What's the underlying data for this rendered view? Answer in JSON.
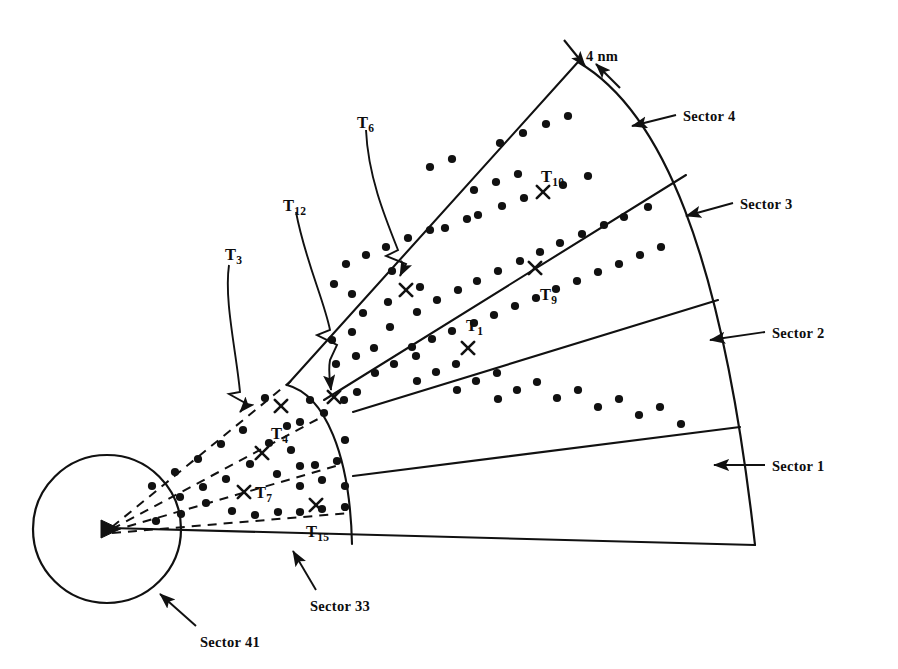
{
  "figure": {
    "type": "sector-coverage-diagram",
    "title": "",
    "scale_annotation": {
      "label": "4 nm",
      "name": "four-nm-scale-marker"
    }
  },
  "origin": {
    "marker": "triangle-marker",
    "x": 110,
    "y": 528
  },
  "inner_circle": {
    "label": "Sector 41",
    "cx": 107,
    "cy": 529,
    "r": 74
  },
  "sector_labels": [
    {
      "id": "sector-1",
      "label": "Sector 1",
      "text_x": 772,
      "text_y": 458,
      "arrow_from_x": 765,
      "arrow_from_y": 465,
      "arrow_to_x": 714,
      "arrow_to_y": 465
    },
    {
      "id": "sector-2",
      "label": "Sector 2",
      "text_x": 772,
      "text_y": 325,
      "arrow_from_x": 765,
      "arrow_from_y": 332,
      "arrow_to_x": 710,
      "arrow_to_y": 340
    },
    {
      "id": "sector-3",
      "label": "Sector 3",
      "text_x": 740,
      "text_y": 196,
      "arrow_from_x": 733,
      "arrow_from_y": 203,
      "arrow_to_x": 686,
      "arrow_to_y": 216
    },
    {
      "id": "sector-4",
      "label": "Sector 4",
      "text_x": 683,
      "text_y": 108,
      "arrow_from_x": 676,
      "arrow_from_y": 115,
      "arrow_to_x": 632,
      "arrow_to_y": 126
    },
    {
      "id": "sector-33",
      "label": "Sector 33",
      "text_x": 310,
      "text_y": 598,
      "arrow_from_x": 316,
      "arrow_from_y": 590,
      "arrow_to_x": 293,
      "arrow_to_y": 551
    },
    {
      "id": "sector-41",
      "label": "Sector 41",
      "text_x": 200,
      "text_y": 634,
      "arrow_from_x": 196,
      "arrow_from_y": 626,
      "arrow_to_x": 160,
      "arrow_to_y": 594
    }
  ],
  "targets": [
    {
      "id": "T1",
      "base": "T",
      "sub": "1",
      "x": 468,
      "y": 348,
      "label_x": 466,
      "label_y": 316
    },
    {
      "id": "T3",
      "base": "T",
      "sub": "3",
      "x": 281,
      "y": 406,
      "label_x": 225,
      "label_y": 245
    },
    {
      "id": "T4",
      "base": "T",
      "sub": "4",
      "x": 262,
      "y": 453,
      "label_x": 271,
      "label_y": 424
    },
    {
      "id": "T6",
      "base": "T",
      "sub": "6",
      "x": 406,
      "y": 290,
      "label_x": 357,
      "label_y": 113
    },
    {
      "id": "T7",
      "base": "T",
      "sub": "7",
      "x": 244,
      "y": 492,
      "label_x": 255,
      "label_y": 483
    },
    {
      "id": "T9",
      "base": "T",
      "sub": "9",
      "x": 535,
      "y": 268,
      "label_x": 540,
      "label_y": 285
    },
    {
      "id": "T10",
      "base": "T",
      "sub": "10",
      "x": 543,
      "y": 192,
      "label_x": 541,
      "label_y": 167
    },
    {
      "id": "T12",
      "base": "T",
      "sub": "12",
      "x": 334,
      "y": 397,
      "label_x": 283,
      "label_y": 196
    },
    {
      "id": "T15",
      "base": "T",
      "sub": "15",
      "x": 316,
      "y": 505,
      "label_x": 306,
      "label_y": 522
    }
  ],
  "detections": {
    "count": 88,
    "marker": "dot",
    "points": [
      [
        392,
        271
      ],
      [
        420,
        287
      ],
      [
        388,
        302
      ],
      [
        417,
        312
      ],
      [
        363,
        313
      ],
      [
        390,
        327
      ],
      [
        437,
        300
      ],
      [
        458,
        290
      ],
      [
        477,
        281
      ],
      [
        498,
        271
      ],
      [
        520,
        261
      ],
      [
        540,
        252
      ],
      [
        560,
        243
      ],
      [
        582,
        234
      ],
      [
        604,
        225
      ],
      [
        624,
        217
      ],
      [
        648,
        207
      ],
      [
        412,
        347
      ],
      [
        432,
        339
      ],
      [
        452,
        331
      ],
      [
        474,
        323
      ],
      [
        494,
        315
      ],
      [
        515,
        306
      ],
      [
        536,
        298
      ],
      [
        556,
        289
      ],
      [
        577,
        281
      ],
      [
        598,
        272
      ],
      [
        619,
        264
      ],
      [
        640,
        255
      ],
      [
        661,
        247
      ],
      [
        430,
        167
      ],
      [
        452,
        159
      ],
      [
        474,
        190
      ],
      [
        496,
        182
      ],
      [
        518,
        174
      ],
      [
        563,
        185
      ],
      [
        588,
        176
      ],
      [
        500,
        143
      ],
      [
        523,
        133
      ],
      [
        546,
        124
      ],
      [
        568,
        116
      ],
      [
        478,
        215
      ],
      [
        502,
        206
      ],
      [
        524,
        198
      ],
      [
        445,
        228
      ],
      [
        467,
        219
      ],
      [
        408,
        238
      ],
      [
        430,
        230
      ],
      [
        386,
        247
      ],
      [
        366,
        255
      ],
      [
        346,
        264
      ],
      [
        334,
        284
      ],
      [
        352,
        294
      ],
      [
        352,
        332
      ],
      [
        332,
        340
      ],
      [
        356,
        356
      ],
      [
        336,
        364
      ],
      [
        374,
        348
      ],
      [
        394,
        364
      ],
      [
        375,
        373
      ],
      [
        416,
        356
      ],
      [
        436,
        372
      ],
      [
        417,
        381
      ],
      [
        456,
        364
      ],
      [
        476,
        381
      ],
      [
        457,
        390
      ],
      [
        497,
        373
      ],
      [
        517,
        390
      ],
      [
        498,
        399
      ],
      [
        537,
        382
      ],
      [
        557,
        398
      ],
      [
        578,
        390
      ],
      [
        598,
        407
      ],
      [
        619,
        399
      ],
      [
        639,
        415
      ],
      [
        660,
        407
      ],
      [
        681,
        424
      ],
      [
        357,
        392
      ],
      [
        344,
        400
      ],
      [
        310,
        400
      ],
      [
        287,
        426
      ],
      [
        243,
        430
      ],
      [
        221,
        444
      ],
      [
        198,
        459
      ],
      [
        175,
        472
      ],
      [
        152,
        486
      ],
      [
        265,
        398
      ],
      [
        300,
        422
      ],
      [
        324,
        413
      ],
      [
        345,
        440
      ],
      [
        291,
        450
      ],
      [
        315,
        465
      ],
      [
        337,
        461
      ],
      [
        277,
        474
      ],
      [
        300,
        486
      ],
      [
        322,
        480
      ],
      [
        345,
        486
      ],
      [
        206,
        503
      ],
      [
        232,
        511
      ],
      [
        255,
        515
      ],
      [
        278,
        512
      ],
      [
        300,
        512
      ],
      [
        322,
        509
      ],
      [
        345,
        507
      ],
      [
        181,
        514
      ],
      [
        156,
        521
      ],
      [
        300,
        466
      ],
      [
        269,
        443
      ],
      [
        250,
        464
      ],
      [
        226,
        479
      ],
      [
        203,
        487
      ],
      [
        180,
        497
      ]
    ]
  },
  "dashed_rays": {
    "description": "sub-sector dashed rays in Sector 33",
    "count": 4
  }
}
